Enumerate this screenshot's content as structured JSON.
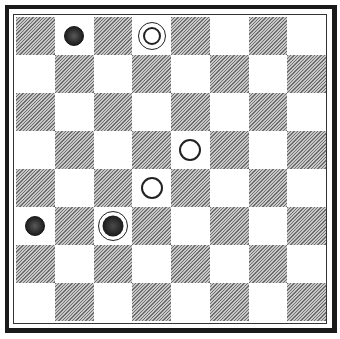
{
  "board": {
    "size": 8,
    "dark_square_parity": "even",
    "colors": {
      "dark": "#9a9a9a",
      "light": "#ffffff",
      "frame": "#1a1a1a"
    },
    "pieces": [
      {
        "row": 0,
        "col": 1,
        "type": "black-man",
        "label": "black man"
      },
      {
        "row": 0,
        "col": 3,
        "type": "white-king",
        "label": "white king"
      },
      {
        "row": 3,
        "col": 4,
        "type": "white-man",
        "label": "white man"
      },
      {
        "row": 4,
        "col": 3,
        "type": "white-man",
        "label": "white man"
      },
      {
        "row": 5,
        "col": 0,
        "type": "black-man",
        "label": "black man"
      },
      {
        "row": 5,
        "col": 2,
        "type": "black-king",
        "label": "black king"
      }
    ]
  }
}
